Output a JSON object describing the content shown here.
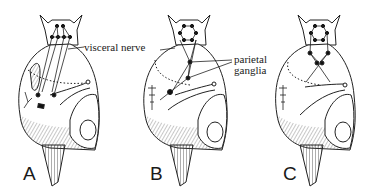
{
  "figure": {
    "panels": [
      {
        "id": "A",
        "label": "A"
      },
      {
        "id": "B",
        "label": "B"
      },
      {
        "id": "C",
        "label": "C"
      }
    ],
    "annotations": {
      "visceral_nerve": "visceral nerve",
      "parietal_line1": "parietal",
      "parietal_line2": "ganglia"
    }
  }
}
